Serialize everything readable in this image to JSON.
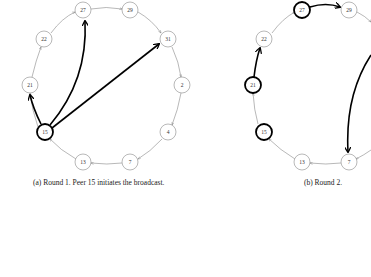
{
  "figure": {
    "panels": [
      {
        "id": "a",
        "caption": "(a)  Round 1. Peer 15 initiates the broadcast.",
        "nodes": [
          {
            "label": "27",
            "x": 83,
            "y": 10,
            "bold": false
          },
          {
            "label": "29",
            "x": 130,
            "y": 10,
            "bold": false
          },
          {
            "label": "31",
            "x": 168,
            "y": 39,
            "bold": false
          },
          {
            "label": "2",
            "x": 182,
            "y": 85,
            "bold": false
          },
          {
            "label": "4",
            "x": 168,
            "y": 132,
            "bold": false
          },
          {
            "label": "7",
            "x": 130,
            "y": 162,
            "bold": false
          },
          {
            "label": "13",
            "x": 83,
            "y": 162,
            "bold": false
          },
          {
            "label": "15",
            "x": 45,
            "y": 132,
            "bold": true
          },
          {
            "label": "21",
            "x": 30,
            "y": 85,
            "bold": false
          },
          {
            "label": "22",
            "x": 44,
            "y": 39,
            "bold": false
          }
        ],
        "broadcast_edges": [
          {
            "from": "15",
            "to": "21"
          },
          {
            "from": "15",
            "to": "27"
          },
          {
            "from": "15",
            "to": "31"
          }
        ]
      },
      {
        "id": "b",
        "caption": "(b)  Round 2.",
        "nodes": [
          {
            "label": "27",
            "x": 302,
            "y": 10,
            "bold": true
          },
          {
            "label": "29",
            "x": 349,
            "y": 10,
            "bold": false
          },
          {
            "label": "22",
            "x": 264,
            "y": 39,
            "bold": false
          },
          {
            "label": "21",
            "x": 253,
            "y": 85,
            "bold": true
          },
          {
            "label": "15",
            "x": 264,
            "y": 132,
            "bold": true
          },
          {
            "label": "13",
            "x": 302,
            "y": 162,
            "bold": false
          },
          {
            "label": "7",
            "x": 349,
            "y": 162,
            "bold": false
          }
        ],
        "broadcast_edges": [
          {
            "from": "27",
            "to": "29"
          },
          {
            "from": "21",
            "to": "22"
          },
          {
            "from": "31",
            "to": "7"
          }
        ]
      }
    ]
  }
}
